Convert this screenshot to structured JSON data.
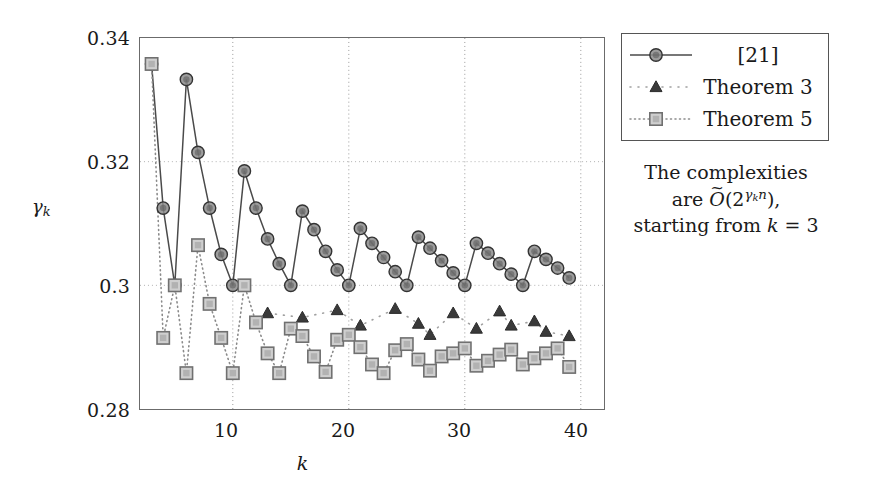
{
  "chart_data": {
    "type": "line",
    "title": "",
    "xlabel": "k",
    "ylabel": "gamma_k",
    "xlim": [
      2,
      42
    ],
    "ylim": [
      0.28,
      0.34
    ],
    "xticks": [
      10,
      20,
      30,
      40
    ],
    "yticks": [
      0.28,
      0.3,
      0.32,
      0.34
    ],
    "ytick_labels": [
      "0.28",
      "0.3",
      "0.32",
      "0.34"
    ],
    "xtick_labels": [
      "10",
      "20",
      "30",
      "40"
    ],
    "grid": "dotted vertical at xticks, dotted horizontal at yticks",
    "legend_position": "outside right top",
    "series": [
      {
        "name": "[21]",
        "marker": "circle",
        "line": "solid",
        "color": "#4d4d4d",
        "x": [
          3,
          4,
          5,
          6,
          7,
          8,
          9,
          10,
          11,
          12,
          13,
          14,
          15,
          16,
          17,
          18,
          19,
          20,
          21,
          22,
          23,
          24,
          25,
          26,
          27,
          28,
          29,
          30,
          31,
          32,
          33,
          34,
          35,
          36,
          37,
          38,
          39
        ],
        "values": [
          0.3358,
          0.3125,
          0.3,
          0.3333,
          0.3215,
          0.3125,
          0.305,
          0.3,
          0.3185,
          0.3125,
          0.3075,
          0.3035,
          0.3,
          0.312,
          0.309,
          0.3055,
          0.3025,
          0.3,
          0.3092,
          0.3068,
          0.3045,
          0.3022,
          0.3,
          0.3078,
          0.306,
          0.304,
          0.302,
          0.3,
          0.3068,
          0.3052,
          0.3035,
          0.3018,
          0.3,
          0.3055,
          0.3042,
          0.3028,
          0.3012
        ]
      },
      {
        "name": "Theorem 3",
        "marker": "triangle",
        "line": "dotted-sparse",
        "color": "#3a3a3a",
        "x": [
          13,
          16,
          19,
          21,
          24,
          26,
          27,
          29,
          31,
          33,
          34,
          36,
          37,
          39
        ],
        "values": [
          0.2955,
          0.2948,
          0.296,
          0.2935,
          0.2962,
          0.2938,
          0.292,
          0.2955,
          0.293,
          0.2958,
          0.2935,
          0.2942,
          0.2925,
          0.2918
        ]
      },
      {
        "name": "Theorem 5",
        "marker": "square",
        "line": "dotted-dense",
        "color": "#6e6e6e",
        "x": [
          3,
          4,
          5,
          6,
          7,
          8,
          9,
          10,
          11,
          12,
          13,
          14,
          15,
          16,
          17,
          18,
          19,
          20,
          21,
          22,
          23,
          24,
          25,
          26,
          27,
          28,
          29,
          30,
          31,
          32,
          33,
          34,
          35,
          36,
          37,
          38,
          39
        ],
        "values": [
          0.3358,
          0.2915,
          0.3,
          0.2858,
          0.3065,
          0.297,
          0.2915,
          0.2858,
          0.3,
          0.294,
          0.289,
          0.2858,
          0.293,
          0.2918,
          0.2885,
          0.286,
          0.2912,
          0.292,
          0.29,
          0.2872,
          0.2858,
          0.2895,
          0.2905,
          0.288,
          0.2862,
          0.2885,
          0.289,
          0.2898,
          0.287,
          0.2878,
          0.2888,
          0.2896,
          0.2872,
          0.2882,
          0.289,
          0.2898,
          0.2868
        ]
      }
    ]
  },
  "legend": {
    "items": [
      {
        "label": "[21]",
        "marker": "circle",
        "line": "solid"
      },
      {
        "label": "Theorem 3",
        "marker": "triangle",
        "line": "dotted-sparse"
      },
      {
        "label": "Theorem 5",
        "marker": "square",
        "line": "dotted-dense"
      }
    ]
  },
  "caption": {
    "line1": "The complexities",
    "line2_prefix": "are ",
    "line2_symbol": "O",
    "line2_open": "(2",
    "line2_exp_gamma": "γ",
    "line2_exp_sub": "k",
    "line2_exp_n": "n",
    "line2_close": "),",
    "line3_prefix": "starting from ",
    "line3_var": "k",
    "line3_eq": " = 3"
  },
  "axes": {
    "ylabel_symbol": "γ",
    "ylabel_sub": "k",
    "xlabel": "k"
  }
}
